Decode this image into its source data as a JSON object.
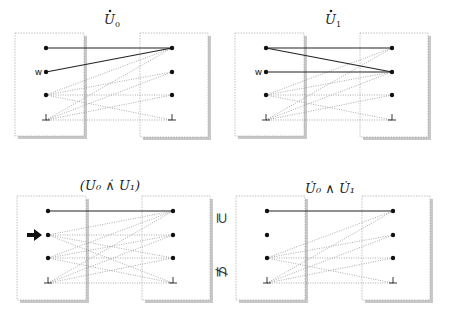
{
  "panels": [
    {
      "id": "u0",
      "title": {
        "text": "U",
        "sub": "0",
        "dotted": true
      },
      "title_pos": [
        112,
        24
      ],
      "left_box": [
        15,
        33,
        69,
        103
      ],
      "right_box": [
        140,
        33,
        68,
        104
      ],
      "left_x": 46,
      "right_x": 172,
      "ys": [
        48,
        72,
        95,
        120
      ],
      "left_labels": [
        "",
        "w",
        "",
        ""
      ],
      "arrow_at": null,
      "left_bottom": true,
      "right_bottom": true,
      "solid": [
        [
          0,
          0
        ],
        [
          1,
          0
        ]
      ],
      "dotted": [
        [
          2,
          0
        ],
        [
          2,
          1
        ],
        [
          2,
          2
        ],
        [
          2,
          3
        ],
        [
          3,
          0
        ],
        [
          3,
          1
        ],
        [
          3,
          2
        ],
        [
          3,
          3
        ]
      ]
    },
    {
      "id": "u1",
      "title": {
        "text": "U",
        "sub": "1",
        "dotted": true
      },
      "title_pos": [
        333,
        24
      ],
      "left_box": [
        235,
        33,
        69,
        103
      ],
      "right_box": [
        360,
        33,
        68,
        104
      ],
      "left_x": 266,
      "right_x": 392,
      "ys": [
        48,
        72,
        95,
        120
      ],
      "left_labels": [
        "",
        "w",
        "",
        ""
      ],
      "arrow_at": null,
      "left_bottom": true,
      "right_bottom": true,
      "solid": [
        [
          0,
          0
        ],
        [
          0,
          1
        ],
        [
          1,
          1
        ]
      ],
      "dotted": [
        [
          2,
          0
        ],
        [
          2,
          1
        ],
        [
          2,
          2
        ],
        [
          2,
          3
        ],
        [
          3,
          0
        ],
        [
          3,
          1
        ],
        [
          3,
          2
        ],
        [
          3,
          3
        ]
      ]
    },
    {
      "id": "u0-dotwedge-u1",
      "title": {
        "text": "(U₀ ∧̇ U₁)",
        "sub": "",
        "dotted": false
      },
      "title_pos": [
        110,
        190
      ],
      "left_box": [
        17,
        196,
        69,
        104
      ],
      "right_box": [
        142,
        196,
        68,
        104
      ],
      "left_x": 48,
      "right_x": 173,
      "ys": [
        211,
        235,
        258,
        283
      ],
      "left_labels": [
        "",
        "",
        "",
        ""
      ],
      "arrow_at": 1,
      "left_bottom": true,
      "right_bottom": true,
      "solid": [
        [
          0,
          0
        ]
      ],
      "dotted": [
        [
          1,
          0
        ],
        [
          1,
          1
        ],
        [
          1,
          2
        ],
        [
          1,
          3
        ],
        [
          2,
          0
        ],
        [
          2,
          1
        ],
        [
          2,
          2
        ],
        [
          2,
          3
        ],
        [
          3,
          0
        ],
        [
          3,
          1
        ],
        [
          3,
          2
        ],
        [
          3,
          3
        ]
      ]
    },
    {
      "id": "u0dot-wedge-u1dot",
      "title": {
        "text": "U̇₀ ∧ U̇₁",
        "sub": "",
        "dotted": false
      },
      "title_pos": [
        330,
        193
      ],
      "left_box": [
        236,
        196,
        69,
        104
      ],
      "right_box": [
        362,
        196,
        68,
        104
      ],
      "left_x": 267,
      "right_x": 393,
      "ys": [
        211,
        235,
        258,
        283
      ],
      "left_labels": [
        "",
        "",
        "",
        ""
      ],
      "arrow_at": null,
      "left_bottom": true,
      "right_bottom": true,
      "solid": [
        [
          0,
          0
        ]
      ],
      "dotted": [
        [
          2,
          0
        ],
        [
          2,
          1
        ],
        [
          2,
          2
        ],
        [
          2,
          3
        ],
        [
          3,
          0
        ],
        [
          3,
          1
        ],
        [
          3,
          2
        ],
        [
          3,
          3
        ]
      ]
    }
  ],
  "relations": [
    {
      "symbol": "⊇",
      "x": 222,
      "y": 223
    },
    {
      "symbol": "⊈",
      "x": 222,
      "y": 277
    }
  ],
  "labels": {
    "w": "w",
    "bottom": "⊥",
    "arrow": "➔"
  }
}
